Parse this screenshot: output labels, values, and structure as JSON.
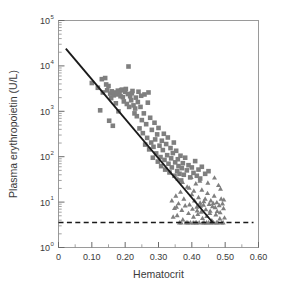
{
  "chart_data": {
    "type": "scatter",
    "title": "",
    "xlabel": "Hematocrit",
    "ylabel": "Plasma erythropoietin (U/L)",
    "xlim": [
      0,
      0.6
    ],
    "ylim": [
      1,
      100000
    ],
    "yscale": "log",
    "xscale": "linear",
    "grid": false,
    "legend": "none",
    "xticks": [
      0,
      0.1,
      0.2,
      0.3,
      0.4,
      0.5,
      0.6
    ],
    "xtick_labels": [
      "0",
      "0.10",
      "0.20",
      "0.30",
      "0.40",
      "0.50",
      "0.60"
    ],
    "xminor_step": 0.05,
    "yticks": [
      1,
      10,
      100,
      1000,
      10000,
      100000
    ],
    "ytick_mantissa": "10",
    "ytick_exponents": [
      "0",
      "1",
      "2",
      "3",
      "4",
      "5"
    ],
    "marker_color": "#7f7f7f",
    "line_color": "#1a1a1a",
    "frame_color": "#9a9a9a",
    "series": [
      {
        "name": "squares",
        "marker": "square",
        "points": [
          [
            0.1,
            4200
          ],
          [
            0.118,
            3300
          ],
          [
            0.125,
            1050
          ],
          [
            0.13,
            5100
          ],
          [
            0.133,
            2600
          ],
          [
            0.14,
            5400
          ],
          [
            0.143,
            3900
          ],
          [
            0.146,
            2900
          ],
          [
            0.15,
            3600
          ],
          [
            0.152,
            620
          ],
          [
            0.155,
            2450
          ],
          [
            0.158,
            1950
          ],
          [
            0.16,
            2750
          ],
          [
            0.163,
            480
          ],
          [
            0.166,
            2250
          ],
          [
            0.17,
            2600
          ],
          [
            0.172,
            1500
          ],
          [
            0.175,
            2350
          ],
          [
            0.178,
            2850
          ],
          [
            0.18,
            1000
          ],
          [
            0.183,
            2500
          ],
          [
            0.186,
            2150
          ],
          [
            0.188,
            2900
          ],
          [
            0.19,
            3000
          ],
          [
            0.193,
            2050
          ],
          [
            0.196,
            1650
          ],
          [
            0.2,
            2700
          ],
          [
            0.202,
            3100
          ],
          [
            0.205,
            1450
          ],
          [
            0.208,
            2400
          ],
          [
            0.21,
            9700
          ],
          [
            0.212,
            1250
          ],
          [
            0.215,
            2150
          ],
          [
            0.218,
            1750
          ],
          [
            0.22,
            2500
          ],
          [
            0.222,
            2800
          ],
          [
            0.225,
            1350
          ],
          [
            0.228,
            900
          ],
          [
            0.23,
            1150
          ],
          [
            0.232,
            2000
          ],
          [
            0.235,
            780
          ],
          [
            0.238,
            1600
          ],
          [
            0.24,
            2700
          ],
          [
            0.243,
            420
          ],
          [
            0.246,
            1250
          ],
          [
            0.248,
            2200
          ],
          [
            0.25,
            640
          ],
          [
            0.253,
            330
          ],
          [
            0.256,
            900
          ],
          [
            0.258,
            2350
          ],
          [
            0.26,
            185
          ],
          [
            0.263,
            520
          ],
          [
            0.266,
            260
          ],
          [
            0.268,
            1550
          ],
          [
            0.27,
            2600
          ],
          [
            0.272,
            145
          ],
          [
            0.275,
            720
          ],
          [
            0.278,
            205
          ],
          [
            0.28,
            390
          ],
          [
            0.283,
            95
          ],
          [
            0.285,
            165
          ],
          [
            0.288,
            560
          ],
          [
            0.29,
            240
          ],
          [
            0.293,
            118
          ],
          [
            0.296,
            310
          ],
          [
            0.298,
            78
          ],
          [
            0.3,
            430
          ],
          [
            0.303,
            175
          ],
          [
            0.306,
            98
          ],
          [
            0.308,
            62
          ],
          [
            0.31,
            225
          ],
          [
            0.313,
            140
          ],
          [
            0.316,
            320
          ],
          [
            0.318,
            85
          ],
          [
            0.32,
            52
          ],
          [
            0.323,
            190
          ],
          [
            0.326,
            108
          ],
          [
            0.328,
            265
          ],
          [
            0.33,
            70
          ],
          [
            0.333,
            45
          ],
          [
            0.336,
            155
          ],
          [
            0.338,
            92
          ],
          [
            0.34,
            58
          ],
          [
            0.343,
            120
          ],
          [
            0.346,
            205
          ],
          [
            0.348,
            38
          ],
          [
            0.35,
            75
          ],
          [
            0.353,
            135
          ],
          [
            0.356,
            48
          ],
          [
            0.358,
            88
          ],
          [
            0.36,
            62
          ],
          [
            0.363,
            42
          ],
          [
            0.366,
            105
          ],
          [
            0.368,
            30
          ],
          [
            0.37,
            56
          ],
          [
            0.373,
            72
          ],
          [
            0.376,
            40
          ],
          [
            0.38,
            95
          ],
          [
            0.385,
            50
          ],
          [
            0.39,
            65
          ],
          [
            0.395,
            35
          ],
          [
            0.4,
            58
          ],
          [
            0.405,
            44
          ],
          [
            0.41,
            80
          ],
          [
            0.415,
            38
          ],
          [
            0.42,
            52
          ],
          [
            0.425,
            33
          ],
          [
            0.43,
            60
          ],
          [
            0.44,
            42
          ],
          [
            0.45,
            48
          ]
        ]
      },
      {
        "name": "triangles",
        "marker": "triangle",
        "points": [
          [
            0.34,
            11
          ],
          [
            0.348,
            7.5
          ],
          [
            0.352,
            14
          ],
          [
            0.356,
            5.2
          ],
          [
            0.36,
            9.5
          ],
          [
            0.363,
            3.6
          ],
          [
            0.366,
            17
          ],
          [
            0.37,
            6.8
          ],
          [
            0.373,
            4.2
          ],
          [
            0.376,
            12
          ],
          [
            0.38,
            8.5
          ],
          [
            0.383,
            3.6
          ],
          [
            0.386,
            22
          ],
          [
            0.39,
            5.8
          ],
          [
            0.393,
            9.0
          ],
          [
            0.396,
            3.6
          ],
          [
            0.4,
            15
          ],
          [
            0.402,
            7.2
          ],
          [
            0.405,
            4.8
          ],
          [
            0.408,
            11
          ],
          [
            0.41,
            3.6
          ],
          [
            0.412,
            26
          ],
          [
            0.415,
            8.0
          ],
          [
            0.418,
            5.5
          ],
          [
            0.42,
            13
          ],
          [
            0.422,
            3.6
          ],
          [
            0.425,
            9.8
          ],
          [
            0.428,
            6.2
          ],
          [
            0.43,
            19
          ],
          [
            0.432,
            4.5
          ],
          [
            0.435,
            8.8
          ],
          [
            0.437,
            3.6
          ],
          [
            0.44,
            12
          ],
          [
            0.442,
            7.0
          ],
          [
            0.445,
            5.0
          ],
          [
            0.447,
            16
          ],
          [
            0.45,
            3.6
          ],
          [
            0.452,
            9.2
          ],
          [
            0.455,
            6.5
          ],
          [
            0.457,
            11
          ],
          [
            0.46,
            4.0
          ],
          [
            0.462,
            8.2
          ],
          [
            0.465,
            3.6
          ],
          [
            0.467,
            14
          ],
          [
            0.47,
            7.8
          ],
          [
            0.472,
            5.4
          ],
          [
            0.475,
            10
          ],
          [
            0.478,
            3.6
          ],
          [
            0.48,
            24
          ],
          [
            0.482,
            8.6
          ],
          [
            0.485,
            6.0
          ],
          [
            0.488,
            12
          ],
          [
            0.49,
            3.6
          ],
          [
            0.492,
            9.4
          ],
          [
            0.495,
            7.4
          ],
          [
            0.498,
            4.6
          ],
          [
            0.358,
            33
          ],
          [
            0.372,
            28
          ],
          [
            0.398,
            36
          ],
          [
            0.424,
            30
          ],
          [
            0.448,
            27
          ],
          [
            0.468,
            35
          ],
          [
            0.486,
            20
          ],
          [
            0.404,
            3.6
          ],
          [
            0.414,
            3.6
          ],
          [
            0.434,
            3.6
          ],
          [
            0.444,
            3.6
          ],
          [
            0.458,
            3.6
          ],
          [
            0.474,
            3.6
          ],
          [
            0.494,
            3.6
          ],
          [
            0.368,
            3.6
          ],
          [
            0.388,
            3.6
          ],
          [
            0.392,
            21
          ],
          [
            0.406,
            18
          ],
          [
            0.416,
            6.6
          ],
          [
            0.426,
            8.4
          ],
          [
            0.436,
            10.5
          ],
          [
            0.454,
            5.8
          ],
          [
            0.464,
            9.6
          ],
          [
            0.476,
            6.4
          ],
          [
            0.484,
            4.4
          ],
          [
            0.496,
            11.5
          ],
          [
            0.344,
            4.8
          ],
          [
            0.354,
            8.0
          ]
        ]
      }
    ],
    "regression_line": {
      "name": "regression-line",
      "x_start": 0.022,
      "y_start": 24000,
      "x_end": 0.462,
      "y_end": 3.6
    },
    "reference_line": {
      "name": "detection-limit-line",
      "style": "dashed",
      "y": 3.55,
      "x_start": 0.0,
      "x_end": 0.585
    }
  }
}
